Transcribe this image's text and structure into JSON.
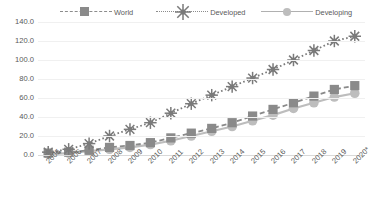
{
  "chart_data": {
    "type": "line",
    "title": "",
    "xlabel": "",
    "ylabel": "",
    "ylim": [
      0,
      140
    ],
    "ytick_step": 20,
    "grid": true,
    "legend_position": "top",
    "categories": [
      "2005",
      "2006",
      "2007",
      "2008",
      "2009",
      "2010",
      "2011",
      "2012",
      "2013",
      "2014",
      "2015",
      "2016",
      "2017",
      "2018",
      "2019",
      "2020*"
    ],
    "series": [
      {
        "name": "World",
        "marker": "square",
        "linestyle": "dashed",
        "color": "#8a8a8a",
        "values": [
          2.0,
          3.0,
          5.0,
          8.0,
          10.0,
          13.0,
          18.0,
          23.0,
          28.0,
          34.0,
          41.0,
          48.0,
          55.0,
          62.0,
          69.0,
          73.0
        ]
      },
      {
        "name": "Developed",
        "marker": "star",
        "linestyle": "dotted",
        "color": "#7a7a7a",
        "values": [
          3.0,
          6.0,
          12.0,
          20.0,
          27.0,
          34.0,
          44.0,
          54.0,
          63.0,
          72.0,
          81.0,
          90.0,
          100.0,
          110.0,
          120.0,
          125.0
        ]
      },
      {
        "name": "Developing",
        "marker": "circle",
        "linestyle": "solid",
        "color": "#bdbdbd",
        "values": [
          1.0,
          2.0,
          4.0,
          6.0,
          8.0,
          11.0,
          15.0,
          20.0,
          25.0,
          30.0,
          36.0,
          42.0,
          49.0,
          55.0,
          61.0,
          65.0
        ]
      }
    ],
    "ytick_labels": [
      "140.0",
      "120.0",
      "100.0",
      "80.0",
      "60.0",
      "40.0",
      "20.0",
      "0.0"
    ],
    "ytick_values": [
      140,
      120,
      100,
      80,
      60,
      40,
      20,
      0
    ]
  },
  "legend": {
    "world_label": "World",
    "developed_label": "Developed",
    "developing_label": "Developing"
  },
  "colors": {
    "world": "#8a8a8a",
    "developed": "#7a7a7a",
    "developing": "#bdbdbd",
    "grid": "#f0f0f0",
    "axis": "#d9d9d9",
    "text": "#595959",
    "background": "#ffffff"
  }
}
